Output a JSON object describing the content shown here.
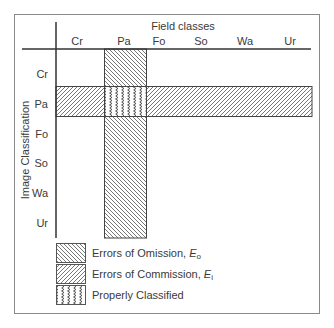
{
  "diagram": {
    "column_axis_title": "Field classes",
    "row_axis_title": "Image Classification",
    "columns": [
      "Cr",
      "Pa",
      "Fo",
      "So",
      "Wa",
      "Ur"
    ],
    "rows": [
      "Cr",
      "Pa",
      "Fo",
      "So",
      "Wa",
      "Ur"
    ],
    "highlighted_column": "Pa",
    "highlighted_row": "Pa",
    "legend": [
      {
        "pattern": "omission",
        "label": "Errors of Omission, ",
        "symbol": "E",
        "subscript": "o"
      },
      {
        "pattern": "commission",
        "label": "Errors of Commission, ",
        "symbol": "E",
        "subscript": "i"
      },
      {
        "pattern": "correct",
        "label": "Properly Classified",
        "symbol": "",
        "subscript": ""
      }
    ]
  }
}
